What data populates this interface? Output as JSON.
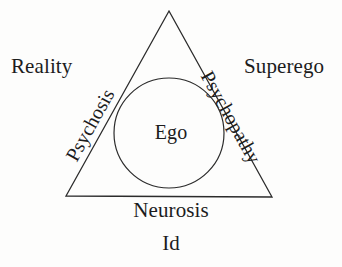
{
  "diagram": {
    "type": "concept-diagram",
    "background_color": "#fdfdfc",
    "stroke_color": "#2b2b2b",
    "text_color": "#1c1c1c",
    "shapes": {
      "triangle": {
        "name": "psyche-triangle",
        "apex": [
          169,
          11
        ],
        "bottom_left": [
          66,
          196
        ],
        "bottom_right": [
          272,
          197
        ]
      },
      "circle": {
        "name": "ego-circle",
        "center": [
          169,
          133
        ],
        "radius": 55
      }
    },
    "labels": {
      "reality": "Reality",
      "superego": "Superego",
      "psychosis": "Psychosis",
      "psychopathy": "Psychopathy",
      "ego": "Ego",
      "neurosis": "Neurosis",
      "id": "Id"
    }
  }
}
